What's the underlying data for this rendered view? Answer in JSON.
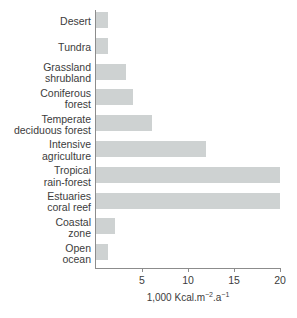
{
  "chart_data": {
    "type": "bar",
    "orientation": "horizontal",
    "title": "",
    "xlabel": "1,000 Kcal.m⁻².a⁻¹",
    "ylabel": "",
    "xlim": [
      0,
      20
    ],
    "xticks": [
      5,
      10,
      15,
      20
    ],
    "xtick_labels": [
      "5",
      "10",
      "15",
      "20"
    ],
    "grid": false,
    "legend": null,
    "bar_color": "#ced2d2",
    "axis_color": "#8c8c8c",
    "categories": [
      "Desert",
      "Tundra",
      "Grassland\nshrubland",
      "Coniferous\nforest",
      "Temperate\ndeciduous forest",
      "Intensive\nagriculture",
      "Tropical\nrain-forest",
      "Estuaries\ncoral reef",
      "Coastal\nzone",
      "Open\nocean"
    ],
    "values": [
      1.3,
      1.3,
      3.3,
      4.0,
      6.1,
      12.0,
      20.0,
      20.0,
      2.1,
      1.3
    ]
  },
  "axis_title_parts": {
    "prefix": "1,000 Kcal.m",
    "sup1": "−2",
    "middle": ".a",
    "sup2": "−1"
  }
}
